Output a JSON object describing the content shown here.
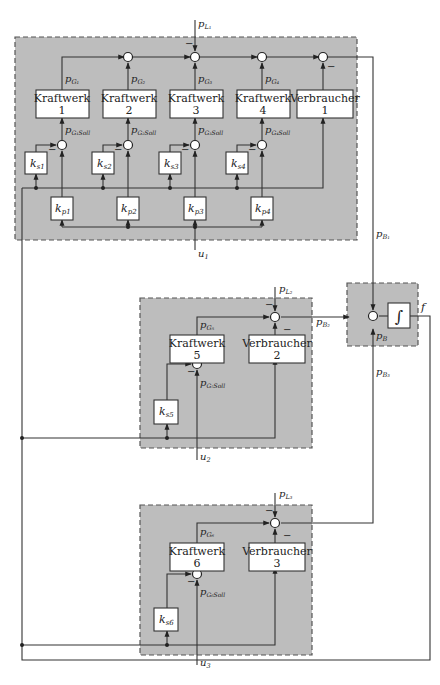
{
  "diagram": {
    "colors": {
      "region_fill": "#bdbdbd",
      "wire": "#333333",
      "box_fill": "#ffffff",
      "border": "#555555"
    },
    "region1": {
      "plants": [
        {
          "name": "Kraftwerk",
          "num": "1",
          "out": "p",
          "out_sub": "G₁",
          "set": "p",
          "set_sub": "G₁Soll",
          "ks": "k",
          "ks_sub": "s1",
          "kp": "k",
          "kp_sub": "p1"
        },
        {
          "name": "Kraftwerk",
          "num": "2",
          "out": "p",
          "out_sub": "G₂",
          "set": "p",
          "set_sub": "G₂Soll",
          "ks": "k",
          "ks_sub": "s2",
          "kp": "k",
          "kp_sub": "p2"
        },
        {
          "name": "Kraftwerk",
          "num": "3",
          "out": "p",
          "out_sub": "G₃",
          "set": "p",
          "set_sub": "G₃Soll",
          "ks": "k",
          "ks_sub": "s3",
          "kp": "k",
          "kp_sub": "p3"
        },
        {
          "name": "Kraftwerk",
          "num": "4",
          "out": "p",
          "out_sub": "G₄",
          "set": "p",
          "set_sub": "G₄Soll",
          "ks": "k",
          "ks_sub": "s4",
          "kp": "k",
          "kp_sub": "p4"
        }
      ],
      "consumer": {
        "name": "Verbraucher",
        "num": "1"
      },
      "load": "p",
      "load_sub": "L₁",
      "input": "u",
      "input_sub": "1",
      "tie": "p",
      "tie_sub": "B₁",
      "minus": "−"
    },
    "region2": {
      "plant": {
        "name": "Kraftwerk",
        "num": "5",
        "out": "p",
        "out_sub": "G₅",
        "set": "p",
        "set_sub": "G₅Soll",
        "ks": "k",
        "ks_sub": "s5"
      },
      "consumer": {
        "name": "Verbraucher",
        "num": "2"
      },
      "load": "p",
      "load_sub": "L₂",
      "input": "u",
      "input_sub": "2",
      "tie": "p",
      "tie_sub": "B₂"
    },
    "region3": {
      "plant": {
        "name": "Kraftwerk",
        "num": "6",
        "out": "p",
        "out_sub": "G₆",
        "set": "p",
        "set_sub": "G₆Soll",
        "ks": "k",
        "ks_sub": "s6"
      },
      "consumer": {
        "name": "Verbraucher",
        "num": "3"
      },
      "load": "p",
      "load_sub": "L₃",
      "input": "u",
      "input_sub": "3",
      "tie": "p",
      "tie_sub": "B₃"
    },
    "integrator": {
      "symbol": "∫",
      "sum_label": "p",
      "sum_sub": "B",
      "output": "f"
    }
  }
}
